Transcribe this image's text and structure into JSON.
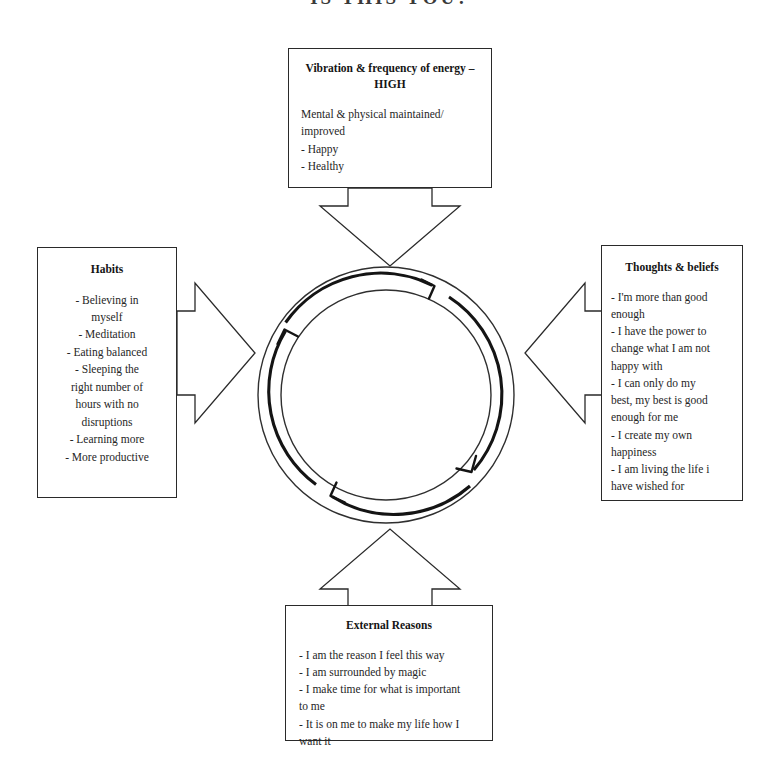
{
  "page": {
    "title": "IS THIS YOU?"
  },
  "boxes": {
    "top": {
      "heading": "Vibration & frequency of energy –\nHIGH",
      "lines": [
        "Mental & physical maintained/",
        "improved",
        "- Happy",
        "- Healthy"
      ]
    },
    "left": {
      "heading": "Habits",
      "lines": [
        "- Believing in",
        "myself",
        "- Meditation",
        "- Eating balanced",
        "- Sleeping the",
        "right number of",
        "hours with no",
        "disruptions",
        "- Learning more",
        "- More productive"
      ]
    },
    "right": {
      "heading": "Thoughts & beliefs",
      "lines": [
        "- I'm more than good",
        "enough",
        "- I have the power to",
        "change what I am not",
        "happy with",
        "- I can only do my",
        "best, my best is good",
        "enough for me",
        "- I create my own",
        "happiness",
        "- I am living the life i",
        "have wished for"
      ]
    },
    "bottom": {
      "heading": "External Reasons",
      "lines": [
        "- I am the reason I feel this way",
        "- I am surrounded by magic",
        "- I make time for what is important",
        "to me",
        "- It is on me to make my life how I",
        "want it"
      ]
    }
  },
  "connectors": [
    {
      "name": "arrow-top-to-center",
      "direction": "down"
    },
    {
      "name": "arrow-left-to-center",
      "direction": "right"
    },
    {
      "name": "arrow-right-to-center",
      "direction": "left"
    },
    {
      "name": "arrow-bottom-to-center",
      "direction": "up"
    }
  ],
  "cycle": {
    "name": "cyclical-flow-diagram",
    "direction": "clockwise",
    "arc_count": 4,
    "label": ""
  },
  "colors": {
    "background": "#ffffff",
    "stroke": "#2a2a2a",
    "text": "#1b1b1b",
    "arc": "#141414"
  }
}
